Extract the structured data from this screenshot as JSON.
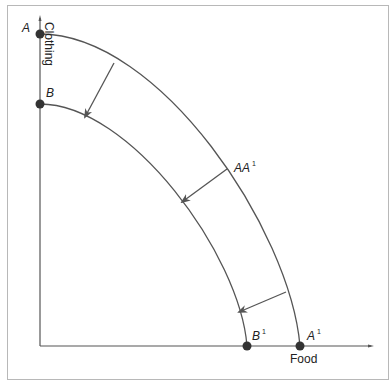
{
  "diagram": {
    "type": "production-possibilities-frontier-shift",
    "axes": {
      "x_label": "Food",
      "y_label": "Clothing"
    },
    "points": [
      {
        "id": "A",
        "label": "A",
        "sup": ""
      },
      {
        "id": "B",
        "label": "B",
        "sup": ""
      },
      {
        "id": "A1",
        "label": "A",
        "sup": "1"
      },
      {
        "id": "B1",
        "label": "B",
        "sup": "1"
      }
    ],
    "curves": [
      {
        "name": "AA1",
        "label": "AA",
        "sup": "1"
      },
      {
        "name": "BB1"
      }
    ],
    "arrows_count": 3,
    "colors": {
      "line": "#555555",
      "dot": "#333333",
      "frame": "#b8b8b8"
    }
  }
}
